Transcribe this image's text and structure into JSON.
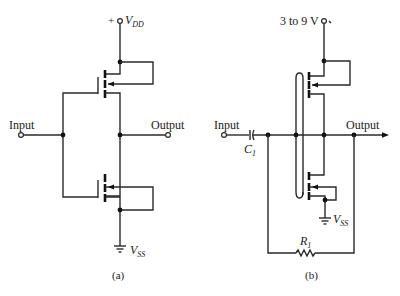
{
  "figure": {
    "type": "CMOS inverter circuit schematics",
    "panels": [
      {
        "id": "a",
        "caption": "(a)",
        "supply_top": {
          "sign": "+",
          "label": "V",
          "sub": "DD"
        },
        "supply_bottom": {
          "label": "V",
          "sub": "SS"
        },
        "input_label": "Input",
        "output_label": "Output",
        "components": [
          "PMOS transistor (top)",
          "NMOS transistor (bottom)"
        ]
      },
      {
        "id": "b",
        "caption": "(b)",
        "supply_top": {
          "label": "3 to 9 V"
        },
        "supply_bottom": {
          "label": "V",
          "sub": "SS"
        },
        "input_label": "Input",
        "output_label": "Output",
        "capacitor": {
          "label": "C",
          "sub": "1"
        },
        "resistor": {
          "label": "R",
          "sub": "1"
        },
        "components": [
          "Coupling capacitor C1",
          "PMOS transistor (top)",
          "NMOS transistor (bottom)",
          "Feedback resistor R1"
        ]
      }
    ]
  },
  "colors": {
    "ink": "#2a2a2a",
    "background": "#ffffff"
  }
}
